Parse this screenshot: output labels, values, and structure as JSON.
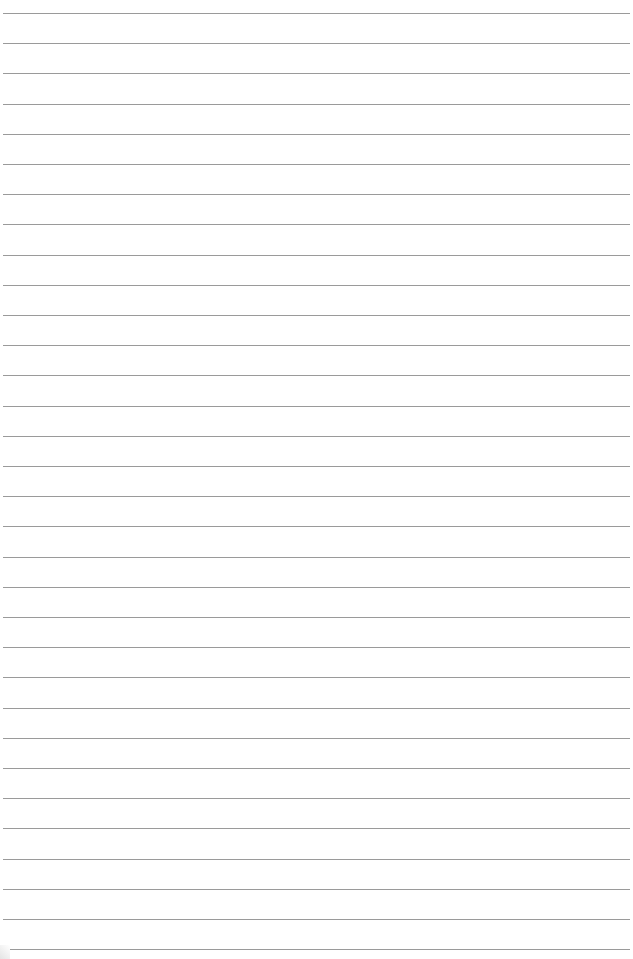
{
  "page": {
    "type": "lined-paper",
    "background_color": "#ffffff",
    "rule_color": "#9a9a9a",
    "rule_count": 32,
    "first_rule_y": 13,
    "rule_spacing": 30.2
  }
}
